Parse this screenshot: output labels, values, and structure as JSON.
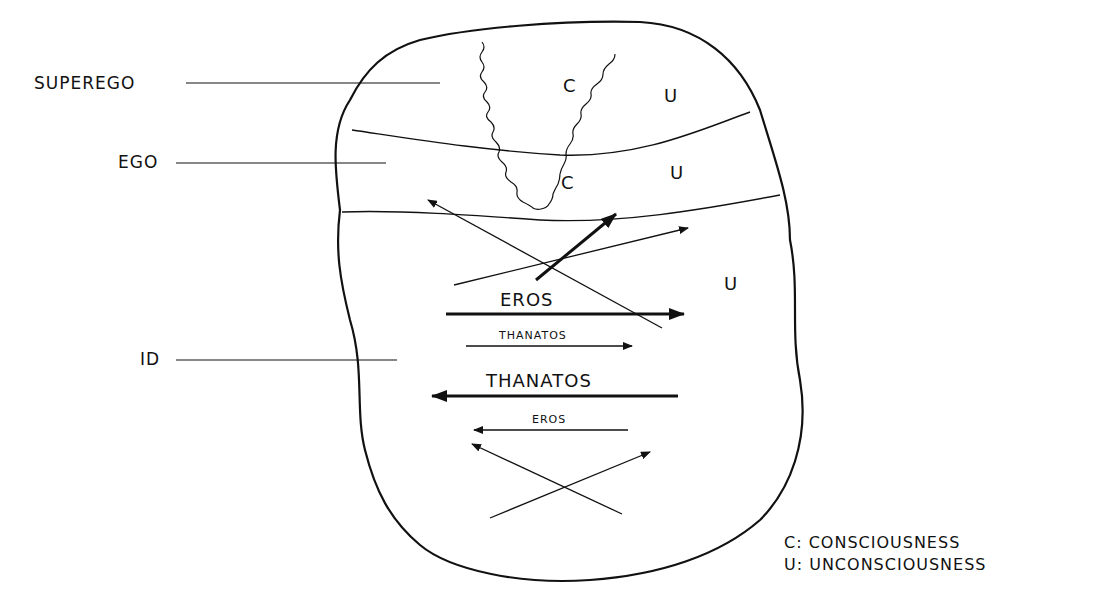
{
  "diagram": {
    "structures": [
      {
        "label": "SUPEREGO"
      },
      {
        "label": "EGO"
      },
      {
        "label": "ID"
      }
    ],
    "regions": {
      "superego_c": "C",
      "superego_u": "U",
      "ego_c": "C",
      "ego_u": "U",
      "id_u": "U"
    },
    "arrows": {
      "eros_big": "EROS",
      "thanatos_small": "THANATOS",
      "thanatos_big": "THANATOS",
      "eros_small": "EROS"
    },
    "legend": [
      {
        "text": "C: CONSCIOUSNESS"
      },
      {
        "text": "U: UNCONSCIOUSNESS"
      }
    ],
    "colors": {
      "ink": "#111111",
      "background": "#ffffff"
    }
  }
}
